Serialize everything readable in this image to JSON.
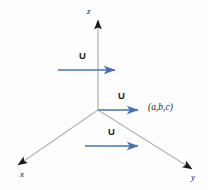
{
  "figure": {
    "background_color": "#fefefe",
    "axis_color": "#b4b4b4",
    "axis_arrowhead_color": "#1a1a1a",
    "vector_color": "#4472b0",
    "text_color": "#1a1a1a"
  },
  "axes": [
    {
      "name": "z-axis",
      "label": "z",
      "label_x": 87,
      "label_y": 7,
      "direction": "up",
      "x1": 98,
      "y1": 110,
      "x2": 98,
      "y2": 18
    },
    {
      "name": "x-axis",
      "label": "x",
      "label_x": 20,
      "label_y": 172,
      "direction": "down-left",
      "x1": 98,
      "y1": 110,
      "x2": 16,
      "y2": 166
    },
    {
      "name": "y-axis",
      "label": "y",
      "label_x": 192,
      "label_y": 175,
      "direction": "down-right",
      "x1": 98,
      "y1": 110,
      "x2": 194,
      "y2": 170
    }
  ],
  "origin": {
    "x": 98,
    "y": 110
  },
  "vectors": [
    {
      "name": "vector-upper",
      "label": "U",
      "label_x": 79,
      "label_y": 52,
      "x1": 58,
      "y1": 70,
      "x2": 118,
      "y2": 70
    },
    {
      "name": "vector-origin",
      "label": "U",
      "label_x": 118,
      "label_y": 92,
      "x1": 98,
      "y1": 110,
      "x2": 141,
      "y2": 110
    },
    {
      "name": "vector-lower",
      "label": "U",
      "label_x": 108,
      "label_y": 128,
      "x1": 85,
      "y1": 146,
      "x2": 141,
      "y2": 146
    }
  ],
  "point": {
    "label": "(a,b,c)",
    "label_x": 148,
    "label_y": 104
  }
}
